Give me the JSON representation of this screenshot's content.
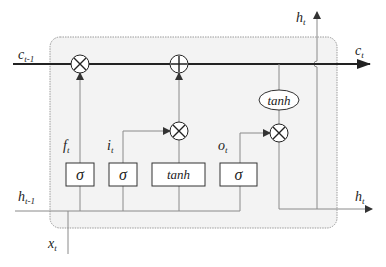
{
  "diagram": {
    "type": "lstm-cell",
    "inputs": {
      "c_prev": {
        "base": "c",
        "sub": "t-1"
      },
      "h_prev": {
        "base": "h",
        "sub": "t-1"
      },
      "x": {
        "base": "x",
        "sub": "t"
      }
    },
    "outputs": {
      "c_out": {
        "base": "c",
        "sub": "t"
      },
      "h_top": {
        "base": "h",
        "sub": "t"
      },
      "h_right": {
        "base": "h",
        "sub": "t"
      }
    },
    "gates": [
      {
        "id": "forget",
        "label": {
          "base": "f",
          "sub": "t"
        },
        "activation": "σ"
      },
      {
        "id": "input",
        "label": {
          "base": "i",
          "sub": "t"
        },
        "activation": "σ"
      },
      {
        "id": "candidate",
        "activation": "tanh"
      },
      {
        "id": "output",
        "label": {
          "base": "o",
          "sub": "t"
        },
        "activation": "σ"
      }
    ],
    "cell_tanh": "tanh",
    "operators": {
      "multiply": "⊗",
      "add": "⊕"
    },
    "colors": {
      "cell_background": "#f3f3f3",
      "cell_border": "#9a9a9a",
      "main_line": "#222222",
      "thin_line": "#8a8a8a"
    }
  }
}
